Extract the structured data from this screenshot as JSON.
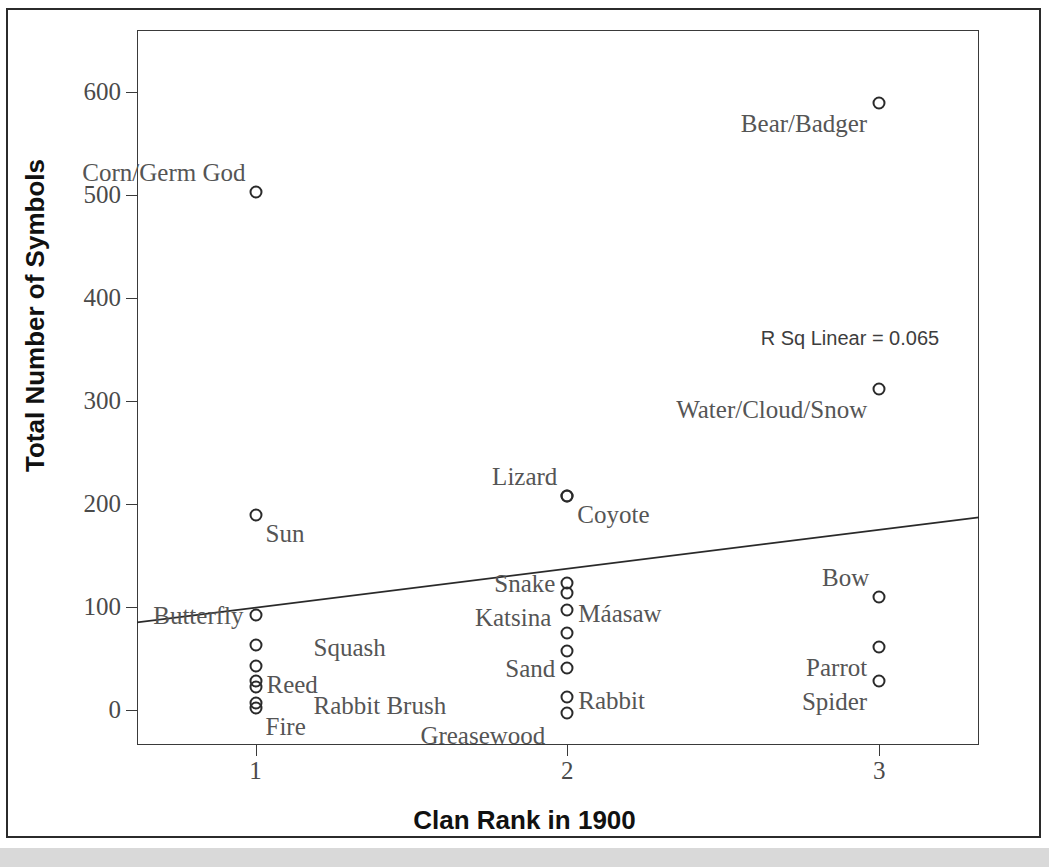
{
  "chart_data": {
    "type": "scatter",
    "title": "",
    "xlabel": "Clan Rank in 1900",
    "ylabel": "Total Number of Symbols",
    "xticks": [
      "1",
      "2",
      "3"
    ],
    "xtick_values": [
      1,
      2,
      3
    ],
    "yticks": [
      "0",
      "100",
      "200",
      "300",
      "400",
      "500",
      "600"
    ],
    "ytick_values": [
      0,
      100,
      200,
      300,
      400,
      500,
      600
    ],
    "xlim": [
      0.62,
      3.32
    ],
    "ylim": [
      -34,
      660
    ],
    "grid": false,
    "legend": null,
    "annotation": "R Sq Linear = 0.065",
    "r_squared": 0.065,
    "fit_line": {
      "type": "linear",
      "x_start": 0.62,
      "y_start": 85,
      "x_end": 3.32,
      "y_end": 187
    },
    "points": [
      {
        "label": "Corn/Germ God",
        "x": 1,
        "y": 503,
        "label_pos": "above-left"
      },
      {
        "label": "Sun",
        "x": 1,
        "y": 189,
        "label_pos": "below-right"
      },
      {
        "label": "Butterfly",
        "x": 1,
        "y": 92,
        "label_pos": "left"
      },
      {
        "label": "Squash",
        "x": 1,
        "y": 63,
        "label_pos": "right-far"
      },
      {
        "label": "",
        "x": 1,
        "y": 43,
        "label_pos": "none"
      },
      {
        "label": "Reed",
        "x": 1,
        "y": 28,
        "label_pos": "right"
      },
      {
        "label": "",
        "x": 1,
        "y": 22,
        "label_pos": "none"
      },
      {
        "label": "Rabbit Brush",
        "x": 1,
        "y": 7,
        "label_pos": "right-far"
      },
      {
        "label": "Fire",
        "x": 1,
        "y": 2,
        "label_pos": "below-right"
      },
      {
        "label": "Lizard",
        "x": 2,
        "y": 208,
        "label_pos": "above-left"
      },
      {
        "label": "Coyote",
        "x": 2,
        "y": 208,
        "label_pos": "below-right"
      },
      {
        "label": "Snake",
        "x": 2,
        "y": 123,
        "label_pos": "left"
      },
      {
        "label": "",
        "x": 2,
        "y": 114,
        "label_pos": "none"
      },
      {
        "label": "Máasaw",
        "x": 2,
        "y": 97,
        "label_pos": "right"
      },
      {
        "label": "Katsina",
        "x": 2,
        "y": 75,
        "label_pos": "left-above"
      },
      {
        "label": "",
        "x": 2,
        "y": 57,
        "label_pos": "none"
      },
      {
        "label": "Sand",
        "x": 2,
        "y": 41,
        "label_pos": "left"
      },
      {
        "label": "Rabbit",
        "x": 2,
        "y": 13,
        "label_pos": "right"
      },
      {
        "label": "Greasewood",
        "x": 2,
        "y": -3,
        "label_pos": "left-below"
      },
      {
        "label": "Bear/Badger",
        "x": 3,
        "y": 589,
        "label_pos": "below-left"
      },
      {
        "label": "Water/Cloud/Snow",
        "x": 3,
        "y": 312,
        "label_pos": "below-left"
      },
      {
        "label": "Bow",
        "x": 3,
        "y": 110,
        "label_pos": "above-left"
      },
      {
        "label": "Parrot",
        "x": 3,
        "y": 61,
        "label_pos": "below-left"
      },
      {
        "label": "Spider",
        "x": 3,
        "y": 28,
        "label_pos": "below-left"
      }
    ]
  },
  "axes": {
    "y_title": "Total Number of Symbols",
    "x_title": "Clan Rank in 1900"
  },
  "annotations": {
    "r_sq": "R Sq Linear = 0.065"
  },
  "labels": {
    "corn_germ_god": "Corn/Germ God",
    "sun": "Sun",
    "butterfly": "Butterfly",
    "squash": "Squash",
    "reed": "Reed",
    "rabbit_brush": "Rabbit Brush",
    "fire": "Fire",
    "lizard": "Lizard",
    "coyote": "Coyote",
    "snake": "Snake",
    "maasaw": "Máasaw",
    "katsina": "Katsina",
    "sand": "Sand",
    "rabbit": "Rabbit",
    "greasewood": "Greasewood",
    "bear_badger": "Bear/Badger",
    "water_cloud_snow": "Water/Cloud/Snow",
    "bow": "Bow",
    "parrot": "Parrot",
    "spider": "Spider"
  }
}
